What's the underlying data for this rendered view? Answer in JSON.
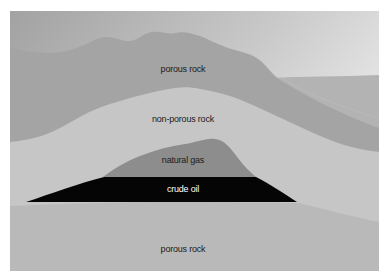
{
  "diagram": {
    "type": "geological cross-section",
    "layers": [
      {
        "id": "top-porous-rock",
        "label": "porous rock",
        "color": "#a3a3a3",
        "label_pos": {
          "x": 183,
          "y": 64
        }
      },
      {
        "id": "non-porous-rock",
        "label": "non-porous rock",
        "color": "#c6c6c6",
        "label_pos": {
          "x": 183,
          "y": 115
        }
      },
      {
        "id": "natural-gas",
        "label": "natural gas",
        "color": "#8c8c8c",
        "label_pos": {
          "x": 183,
          "y": 155
        }
      },
      {
        "id": "crude-oil",
        "label": "crude oil",
        "color": "#050505",
        "label_pos": {
          "x": 183,
          "y": 184
        }
      },
      {
        "id": "bottom-porous-rock",
        "label": "porous rock",
        "color": "#b9b9b9",
        "label_pos": {
          "x": 183,
          "y": 244
        }
      }
    ],
    "colors": {
      "sky_dark": "#9a9a9a",
      "sky_light": "#ececec",
      "distant_hill": "#b2b2b2",
      "frame_bg": "#ffffff"
    }
  }
}
